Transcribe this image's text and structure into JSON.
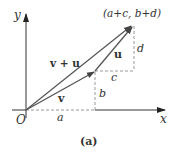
{
  "figure": {
    "caption": "(a)",
    "axes": {
      "x_label": "x",
      "y_label": "y",
      "origin_label": "O"
    },
    "vectors": [
      {
        "name": "v",
        "label": "v"
      },
      {
        "name": "u",
        "label": "u"
      },
      {
        "name": "v+u",
        "label": "v + u"
      }
    ],
    "point_label": "(a+c, b+d)",
    "components": {
      "a": "a",
      "b": "b",
      "c": "c",
      "d": "d"
    },
    "colors": {
      "vector": "#555555",
      "dashed": "#999999",
      "axis": "#333333",
      "text": "#333333"
    }
  }
}
